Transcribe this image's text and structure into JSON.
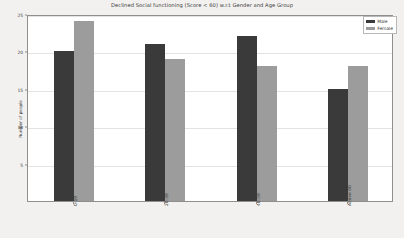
{
  "chart_data": {
    "type": "bar",
    "title": "Declined Social functioning (Score < 60) w.r.t Gender and Age Group",
    "xlabel": "",
    "ylabel": "Number of people",
    "categories": [
      "0-19",
      "20-39",
      "40-59",
      "Above 60"
    ],
    "series": [
      {
        "name": "Male",
        "values": [
          20,
          21,
          22,
          15
        ],
        "color": "#3a3a3a"
      },
      {
        "name": "Female",
        "values": [
          24,
          19,
          18,
          18
        ],
        "color": "#9c9c9c"
      }
    ],
    "ylim": [
      0,
      25
    ],
    "yticks": [
      5,
      10,
      15,
      20,
      25
    ],
    "grid": true,
    "legend_position": "top-right",
    "xtick_rotation": "vertical"
  },
  "figure": {
    "background_color": "#f2f1ef",
    "plot_background_color": "#ffffff",
    "gridline_color": "#e3e3e3",
    "axis_color": "#8e8e8e"
  }
}
